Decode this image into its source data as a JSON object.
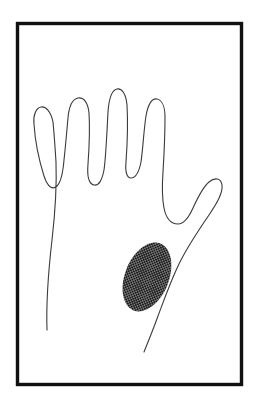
{
  "figure": {
    "caption": "",
    "background_color": "#ffffff",
    "ink_color": "#1a1a1a",
    "outline_color": "#3c3a3a",
    "outline_stroke_width": 1.1,
    "frame": {
      "label": "border-frame",
      "color": "#111111",
      "stroke_width": 3.4,
      "x": 17.5,
      "y": 23.5,
      "width": 224,
      "height": 361
    },
    "canvas": {
      "width": 259,
      "height": 406
    },
    "hand": {
      "label": "hand-outline",
      "view": "palmar",
      "side": "right",
      "fingers": [
        {
          "name": "little-finger",
          "tip_x": 46,
          "tip_y": 105
        },
        {
          "name": "ring-finger",
          "tip_x": 81,
          "tip_y": 71
        },
        {
          "name": "middle-finger",
          "tip_x": 118,
          "tip_y": 58
        },
        {
          "name": "index-finger",
          "tip_x": 157,
          "tip_y": 78
        },
        {
          "name": "thumb",
          "tip_x": 205,
          "tip_y": 179
        }
      ],
      "path": "M 47 330 C 46 300 49 266 52 240 C 55 214 57 190 56 162 C 55 146 54 132 53 122 C 51 112 46 106 41 107 C 36 108 33 115 34 124 C 35 140 39 160 44 176 C 48 188 53 190 57 186 C 61 182 63 172 64 160 C 66 142 67 128 68 118 C 69 106 73 99 78 98 C 84 97 88 103 89 113 C 90 128 89 150 88 164 C 87 176 89 184 94 185 C 99 186 102 180 104 170 C 106 156 107 130 108 112 C 109 98 112 90 117 89 C 122 88 126 94 127 105 C 128 122 127 148 126 162 C 125 172 127 178 131 178 C 136 178 139 172 141 162 C 143 148 144 128 146 116 C 148 104 152 98 157 99 C 162 100 165 107 165 117 C 165 134 164 156 163 172 C 162 186 162 198 164 208 C 166 218 171 224 178 224 C 184 224 189 217 193 208 C 198 197 203 187 209 182 C 215 177 221 178 222 185 C 223 193 217 203 209 215 C 198 231 186 249 178 266 C 170 283 164 300 158 316 C 153 330 148 342 144 352"
    },
    "shaded_region": {
      "label": "cross-hatched-palm-patch",
      "description": "Cross-hatched oval marking on the palm",
      "pattern": "cross-hatch",
      "pattern_spacing_px": 3.2,
      "pattern_stroke_width": 1.1,
      "fill_color": "#1a1a1a",
      "center_x": 147,
      "center_y": 277,
      "radius_x": 22,
      "radius_y": 36,
      "rotation_deg": 22,
      "path": "M 147 241 C 159 241 169 257 169 277 C 169 297 159 313 147 313 C 135 313 125 297 125 277 C 125 257 135 241 147 241 Z"
    }
  }
}
